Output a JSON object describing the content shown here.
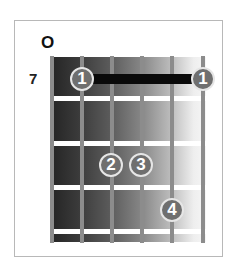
{
  "diagram": {
    "type": "guitar-chord-diagram",
    "open_marker": "O",
    "start_fret_label": "7",
    "strings": 6,
    "frets_shown": 4,
    "colors": {
      "board_dark": "#242424",
      "board_light": "#f6f6f6",
      "string": "#8c8c8c",
      "fret": "#ffffff",
      "finger_fill": "#6f6f6f",
      "finger_border": "#e6e6e6",
      "barre": "#0a0a0a",
      "frame": "#b8b8b8"
    },
    "barre": {
      "finger": "1",
      "fret": 1,
      "from_string": 2,
      "to_string": 6
    },
    "fingers": [
      {
        "label": "1",
        "string": 2,
        "fret": 1
      },
      {
        "label": "1",
        "string": 6,
        "fret": 1
      },
      {
        "label": "2",
        "string": 3,
        "fret": 3
      },
      {
        "label": "3",
        "string": 4,
        "fret": 3
      },
      {
        "label": "4",
        "string": 5,
        "fret": 4
      }
    ]
  }
}
